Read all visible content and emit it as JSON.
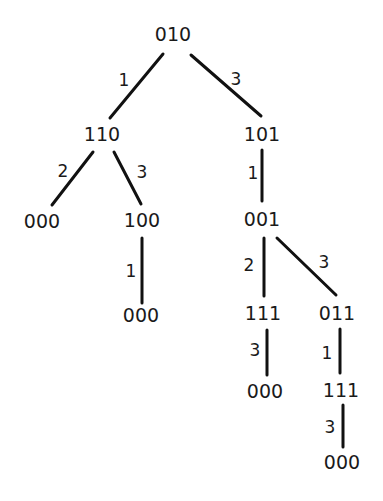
{
  "diagram": {
    "type": "tree",
    "nodes": [
      {
        "id": "n0",
        "label": "010",
        "x": 173,
        "y": 34
      },
      {
        "id": "n1",
        "label": "110",
        "x": 102,
        "y": 134
      },
      {
        "id": "n2",
        "label": "101",
        "x": 262,
        "y": 134
      },
      {
        "id": "n3",
        "label": "000",
        "x": 42,
        "y": 221
      },
      {
        "id": "n4",
        "label": "100",
        "x": 142,
        "y": 220
      },
      {
        "id": "n5",
        "label": "001",
        "x": 262,
        "y": 219
      },
      {
        "id": "n6",
        "label": "000",
        "x": 141,
        "y": 315
      },
      {
        "id": "n7",
        "label": "111",
        "x": 263,
        "y": 313
      },
      {
        "id": "n8",
        "label": "011",
        "x": 337,
        "y": 313
      },
      {
        "id": "n9",
        "label": "000",
        "x": 265,
        "y": 391
      },
      {
        "id": "n10",
        "label": "111",
        "x": 341,
        "y": 390
      },
      {
        "id": "n11",
        "label": "000",
        "x": 342,
        "y": 462
      }
    ],
    "edges": [
      {
        "from": "n0",
        "to": "n1",
        "label": "1",
        "x1": 163,
        "y1": 54,
        "x2": 110,
        "y2": 118,
        "lx": 124,
        "ly": 80
      },
      {
        "from": "n0",
        "to": "n2",
        "label": "3",
        "x1": 191,
        "y1": 55,
        "x2": 261,
        "y2": 116,
        "lx": 236,
        "ly": 79
      },
      {
        "from": "n1",
        "to": "n3",
        "label": "2",
        "x1": 93,
        "y1": 152,
        "x2": 52,
        "y2": 205,
        "lx": 63,
        "ly": 171
      },
      {
        "from": "n1",
        "to": "n4",
        "label": "3",
        "x1": 114,
        "y1": 152,
        "x2": 141,
        "y2": 204,
        "lx": 142,
        "ly": 172
      },
      {
        "from": "n2",
        "to": "n5",
        "label": "1",
        "x1": 262,
        "y1": 150,
        "x2": 262,
        "y2": 201,
        "lx": 253,
        "ly": 173
      },
      {
        "from": "n4",
        "to": "n6",
        "label": "1",
        "x1": 142,
        "y1": 238,
        "x2": 142,
        "y2": 303,
        "lx": 131,
        "ly": 271
      },
      {
        "from": "n5",
        "to": "n7",
        "label": "2",
        "x1": 264,
        "y1": 238,
        "x2": 264,
        "y2": 296,
        "lx": 249,
        "ly": 265
      },
      {
        "from": "n5",
        "to": "n8",
        "label": "3",
        "x1": 277,
        "y1": 238,
        "x2": 336,
        "y2": 295,
        "lx": 324,
        "ly": 262
      },
      {
        "from": "n7",
        "to": "n9",
        "label": "3",
        "x1": 267,
        "y1": 330,
        "x2": 267,
        "y2": 375,
        "lx": 255,
        "ly": 350
      },
      {
        "from": "n8",
        "to": "n10",
        "label": "1",
        "x1": 340,
        "y1": 329,
        "x2": 340,
        "y2": 373,
        "lx": 327,
        "ly": 353
      },
      {
        "from": "n10",
        "to": "n11",
        "label": "3",
        "x1": 343,
        "y1": 405,
        "x2": 343,
        "y2": 447,
        "lx": 330,
        "ly": 427
      }
    ]
  }
}
